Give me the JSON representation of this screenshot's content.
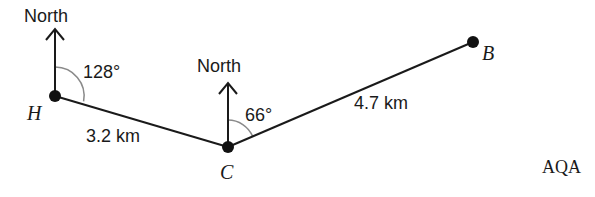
{
  "diagram": {
    "points": [
      {
        "id": "H",
        "label": "H",
        "x": 55,
        "y": 96
      },
      {
        "id": "C",
        "label": "C",
        "x": 228,
        "y": 147
      },
      {
        "id": "B",
        "label": "B",
        "x": 473,
        "y": 42
      }
    ],
    "segments": [
      {
        "from": "H",
        "to": "C",
        "label": "3.2 km"
      },
      {
        "from": "C",
        "to": "B",
        "label": "4.7 km"
      }
    ],
    "north_arrows": [
      {
        "at": "H",
        "label": "North"
      },
      {
        "at": "C",
        "label": "North"
      }
    ],
    "bearings": [
      {
        "at": "H",
        "label": "128°"
      },
      {
        "at": "C",
        "label": "66°"
      }
    ],
    "source": "AQA"
  }
}
